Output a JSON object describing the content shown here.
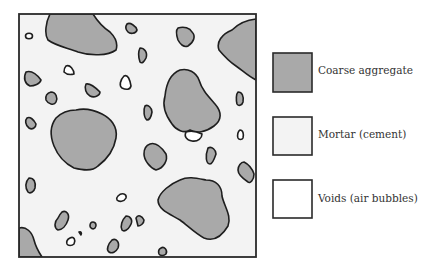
{
  "diagram": {
    "colors": {
      "coarse_aggregate": "#a9a9a9",
      "mortar": "#f3f3f3",
      "voids": "#ffffff",
      "outline": "#1e1e1e"
    }
  },
  "legend": {
    "items": [
      {
        "key": "coarse_aggregate",
        "label": "Coarse aggregate"
      },
      {
        "key": "mortar",
        "label": "Mortar (cement)"
      },
      {
        "key": "voids",
        "label": "Voids (air bubbles)"
      }
    ]
  }
}
